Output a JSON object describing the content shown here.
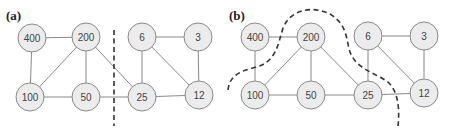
{
  "panels": [
    {
      "label": "(a)",
      "nodes": [
        {
          "id": "400",
          "label": "400",
          "x": 32,
          "y": 38
        },
        {
          "id": "200",
          "label": "200",
          "x": 86,
          "y": 37
        },
        {
          "id": "6",
          "label": "6",
          "x": 142,
          "y": 37
        },
        {
          "id": "3",
          "label": "3",
          "x": 198,
          "y": 37
        },
        {
          "id": "100",
          "label": "100",
          "x": 30,
          "y": 97
        },
        {
          "id": "50",
          "label": "50",
          "x": 86,
          "y": 97
        },
        {
          "id": "25",
          "label": "25",
          "x": 142,
          "y": 97
        },
        {
          "id": "12",
          "label": "12",
          "x": 199,
          "y": 95
        }
      ],
      "edges": [
        [
          "400",
          "200"
        ],
        [
          "400",
          "100"
        ],
        [
          "200",
          "100"
        ],
        [
          "200",
          "50"
        ],
        [
          "200",
          "25"
        ],
        [
          "100",
          "50"
        ],
        [
          "50",
          "25"
        ],
        [
          "6",
          "3"
        ],
        [
          "6",
          "25"
        ],
        [
          "6",
          "12"
        ],
        [
          "3",
          "12"
        ],
        [
          "25",
          "12"
        ]
      ],
      "cut": "straight vertical dashed line between node groups"
    },
    {
      "label": "(b)",
      "nodes": [
        {
          "id": "400",
          "label": "400",
          "x": 255,
          "y": 37
        },
        {
          "id": "200",
          "label": "200",
          "x": 311,
          "y": 37
        },
        {
          "id": "6",
          "label": "6",
          "x": 368,
          "y": 36
        },
        {
          "id": "3",
          "label": "3",
          "x": 424,
          "y": 36
        },
        {
          "id": "100",
          "label": "100",
          "x": 255,
          "y": 95
        },
        {
          "id": "50",
          "label": "50",
          "x": 311,
          "y": 95
        },
        {
          "id": "25",
          "label": "25",
          "x": 368,
          "y": 95
        },
        {
          "id": "12",
          "label": "12",
          "x": 424,
          "y": 93
        }
      ],
      "edges": [
        [
          "400",
          "200"
        ],
        [
          "400",
          "100"
        ],
        [
          "200",
          "100"
        ],
        [
          "200",
          "50"
        ],
        [
          "200",
          "25"
        ],
        [
          "100",
          "50"
        ],
        [
          "50",
          "25"
        ],
        [
          "6",
          "3"
        ],
        [
          "6",
          "25"
        ],
        [
          "6",
          "12"
        ],
        [
          "3",
          "12"
        ],
        [
          "25",
          "12"
        ]
      ],
      "cut": "curved dashed line separating 400 from the rest"
    }
  ],
  "node_radius": 14,
  "colors": {
    "node_fill": "#ececec",
    "node_stroke": "#8a8a8a",
    "edge": "#8a8a8a",
    "cut_line": "#333333"
  }
}
